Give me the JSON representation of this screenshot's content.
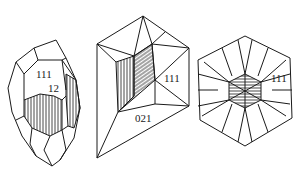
{
  "figure": {
    "type": "crystal habit line drawings",
    "panels": [
      {
        "id": "elongated-crystal",
        "labels": [
          {
            "text": "111",
            "x": 36,
            "y": 78
          },
          {
            "text": "12",
            "x": 48,
            "y": 92
          }
        ]
      },
      {
        "id": "pyramidal-crystal",
        "labels": [
          {
            "text": "111",
            "x": 164,
            "y": 82
          },
          {
            "text": "021",
            "x": 135,
            "y": 122
          }
        ]
      },
      {
        "id": "hexagonal-crystal",
        "labels": [
          {
            "text": "111",
            "x": 271,
            "y": 82
          }
        ]
      }
    ]
  },
  "colors": {
    "ink": "#1a1a1a",
    "paper": "#ffffff"
  }
}
